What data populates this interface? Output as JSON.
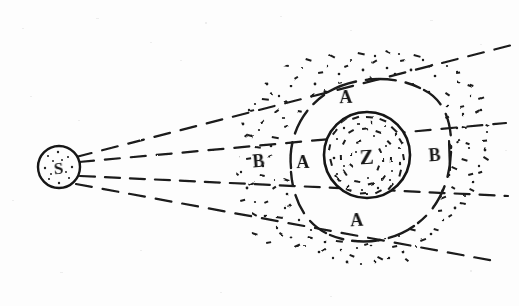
{
  "figure": {
    "medium": "pencil/ink sketch on paper",
    "background_color": "#fdfdfd",
    "ink_color": "#1a1a1a",
    "width": 519,
    "height": 306
  },
  "labels": {
    "source": "S",
    "core": "Z",
    "zone_a_top": "A",
    "zone_a_left": "A",
    "zone_a_bottom": "A",
    "zone_b_left": "B",
    "zone_b_right": "B"
  },
  "elements": {
    "source_circle": {
      "name": "S",
      "cx": 59,
      "cy": 167,
      "r": 21,
      "fill": "stippled",
      "stroke": "#151515"
    },
    "core_circle": {
      "name": "Z",
      "cx": 367,
      "cy": 155,
      "r": 43,
      "fill": "stippled",
      "stroke": "#151515"
    },
    "cloud_region": {
      "name": "B",
      "fill": "stippled",
      "left_edge": 231,
      "right_edge": 492,
      "top_edge": 50,
      "bottom_edge": 277
    },
    "clear_annulus": {
      "name": "A",
      "fill": "none",
      "boundary": "dashed arc"
    }
  },
  "rays": {
    "count": 4,
    "style": "dashed",
    "origin": "S",
    "description": "four dashed lines fanning out to the right from S"
  },
  "label_positions": [
    {
      "text": "S",
      "x": 59,
      "y": 174,
      "size": 17,
      "rotate": -4,
      "name": "source-label"
    },
    {
      "text": "Z",
      "x": 367,
      "y": 164,
      "size": 21,
      "rotate": -3,
      "name": "core-label"
    },
    {
      "text": "A",
      "x": 346,
      "y": 103,
      "size": 18,
      "rotate": -2,
      "name": "zone-a-top-label"
    },
    {
      "text": "A",
      "x": 303,
      "y": 168,
      "size": 18,
      "rotate": -1,
      "name": "zone-a-left-label"
    },
    {
      "text": "A",
      "x": 357,
      "y": 226,
      "size": 18,
      "rotate": -3,
      "name": "zone-a-bottom-label"
    },
    {
      "text": "B",
      "x": 259,
      "y": 167,
      "size": 18,
      "rotate": -5,
      "name": "zone-b-left-label"
    },
    {
      "text": "B",
      "x": 435,
      "y": 161,
      "size": 18,
      "rotate": -4,
      "name": "zone-b-right-label"
    }
  ]
}
